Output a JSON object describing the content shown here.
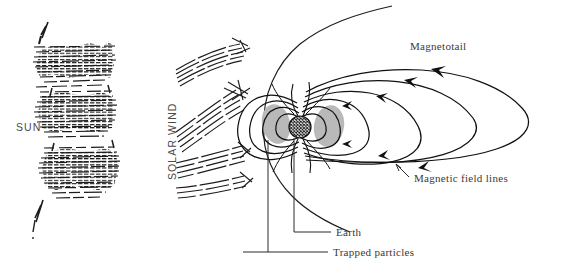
{
  "figure": {
    "background_color": "#ffffff",
    "ink_color": "#1a1a1a",
    "label_color": "#3a3a3a",
    "belt_fill_color": "#b9b9b9"
  },
  "labels": {
    "sun": "SUN",
    "solar_wind": "SOLAR WIND",
    "magnetotail": "Magnetotail",
    "magnetic_field_lines": "Magnetic field lines",
    "earth": "Earth",
    "trapped_particles": "Trapped particles"
  },
  "diagram_data": {
    "type": "schematic",
    "components": [
      {
        "name": "sun",
        "representation": "hatched horizontal bands with jagged edges",
        "bands": 3,
        "x_range": [
          38,
          135
        ],
        "y_range": [
          22,
          245
        ]
      },
      {
        "name": "solar-wind-streamlines",
        "representation": "curved streamline bundles with arrow tips",
        "bundles": 4,
        "x_range": [
          178,
          270
        ],
        "y_range": [
          40,
          190
        ]
      },
      {
        "name": "earth",
        "representation": "cross-hatched circle",
        "center": [
          300,
          127
        ],
        "radius": 11
      },
      {
        "name": "radiation-belts",
        "representation": "two gray ellipses flanking Earth",
        "fill": "#b9b9b9",
        "left_center": [
          277,
          124
        ],
        "right_center": [
          328,
          126
        ]
      },
      {
        "name": "magnetopause",
        "representation": "open boundary curve flaring to upper right"
      },
      {
        "name": "magnetic-field-lines",
        "representation": "nested closed and open field loops with arrowheads",
        "loop_count": 6,
        "tail_extent_x": 548
      }
    ],
    "leader_lines": [
      {
        "target": "magnetic-field-lines",
        "from": [
          410,
          176
        ],
        "to": [
          398,
          166
        ]
      },
      {
        "target": "earth",
        "from": [
          333,
          232
        ],
        "to": [
          283,
          232
        ]
      },
      {
        "target": "trapped-particles",
        "from": [
          330,
          252
        ],
        "to": [
          243,
          252
        ]
      }
    ]
  }
}
